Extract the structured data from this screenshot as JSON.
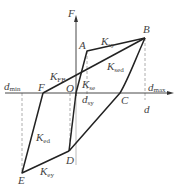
{
  "diagram": {
    "axis_labels": {
      "y": "F",
      "x": "d"
    },
    "points": {
      "O": "O",
      "A": "A",
      "B": "B",
      "C": "C",
      "D": "D",
      "E": "E",
      "F": "F"
    },
    "stiffness_labels": {
      "K_sy": {
        "main": "K",
        "sub": "sy"
      },
      "K_sed": {
        "main": "K",
        "sub": "sed"
      },
      "K_FB": {
        "main": "K",
        "sub": "FB"
      },
      "K_se": {
        "main": "K",
        "sub": "se"
      },
      "K_ed": {
        "main": "K",
        "sub": "ed"
      },
      "K_ey": {
        "main": "K",
        "sub": "ey"
      }
    },
    "displacement_labels": {
      "d_min": {
        "main": "d",
        "sub": "min"
      },
      "d_max": {
        "main": "d",
        "sub": "max"
      },
      "d_sy": {
        "main": "d",
        "sub": "sy"
      }
    },
    "colors": {
      "line": "#222222",
      "dashed": "#999999",
      "text": "#444444"
    }
  }
}
